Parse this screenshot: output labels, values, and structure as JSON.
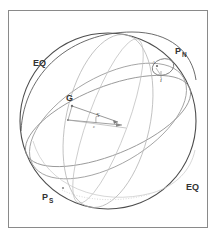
{
  "figure": {
    "kind": "celestial-sphere-diagram",
    "background_color": "#ffffff",
    "frame_color": "#8a8a8a",
    "outline_color": "#555555",
    "circle_color": "#9a9a9a",
    "faint_color": "#c8c8c8",
    "vector_color": "#777777",
    "label_color": "#333333"
  },
  "labels": {
    "north_pole": "P",
    "north_pole_sub": "N",
    "south_pole": "P",
    "south_pole_sub": "S",
    "equator_upper_left": "EQ",
    "equator_lower_right": "EQ",
    "point_g": "G",
    "vector_s": "S",
    "angle_epsilon": "ε",
    "inclination_i": "i",
    "point_a": "A"
  },
  "geometry": {
    "sphere_center_x": 108,
    "sphere_center_y": 121,
    "sphere_radius": 88,
    "precession_circle_cx": 163,
    "precession_circle_cy": 67,
    "precession_circle_rx": 11,
    "precession_circle_ry": 8
  }
}
